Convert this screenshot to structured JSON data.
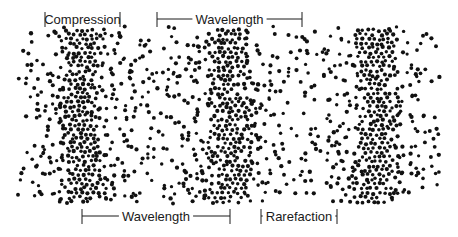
{
  "diagram": {
    "colors": {
      "dots": "#111111",
      "lines": "#1a1a1a",
      "background": "#ffffff"
    },
    "dot_field": {
      "x_min": 20,
      "x_max": 440,
      "y_min": 30,
      "y_max": 205,
      "band_centers": [
        82,
        230,
        376
      ],
      "band_halfwidth": 34,
      "dot_radius": 1.9,
      "sparse_spacing": 13,
      "dense_spacing": 5.2
    },
    "labels": {
      "compression": {
        "text": "Compression",
        "x1": 45,
        "x2": 120,
        "y": 19,
        "position": "top"
      },
      "wavelength_top": {
        "text": "Wavelength",
        "x1": 157,
        "x2": 302,
        "y": 19,
        "position": "top"
      },
      "wavelength_bottom": {
        "text": "Wavelength",
        "x1": 82,
        "x2": 230,
        "y": 216,
        "position": "bottom"
      },
      "rarefaction": {
        "text": "Rarefaction",
        "x1": 261,
        "x2": 337,
        "y": 216,
        "position": "bottom"
      }
    }
  }
}
